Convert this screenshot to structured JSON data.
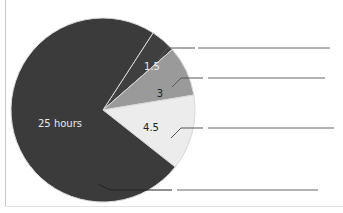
{
  "chart_data": {
    "type": "pie",
    "title": "",
    "unit": "hours",
    "total": 34,
    "slices": [
      {
        "label": "25 hours",
        "value": 25,
        "color": "#3b3b3b",
        "text_color": "#e8e8e8"
      },
      {
        "label": "1.5",
        "value": 1.5,
        "color": "#3f3f3f",
        "text_color": "#e8e8e8"
      },
      {
        "label": "3",
        "value": 3,
        "color": "#9a9a9a",
        "text_color": "#222222"
      },
      {
        "label": "4.5",
        "value": 4.5,
        "color": "#ececec",
        "text_color": "#222222"
      }
    ],
    "leader_lines": 4,
    "legend": "blank leader lines to the right (answer blanks)"
  }
}
